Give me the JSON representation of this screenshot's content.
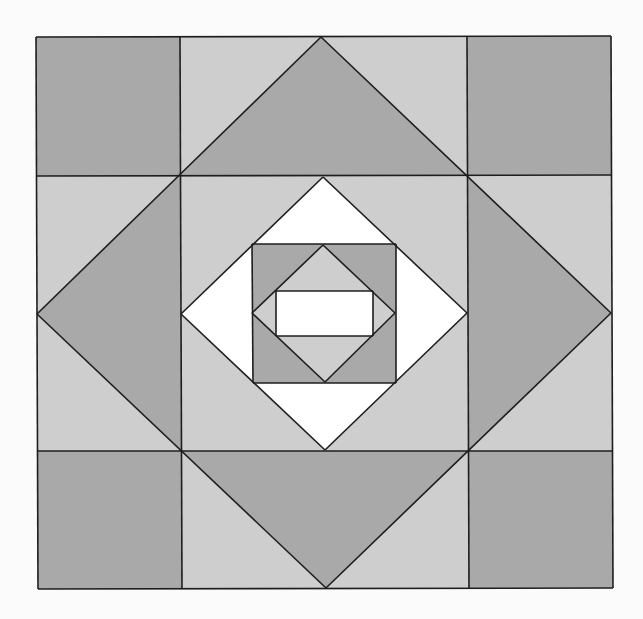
{
  "diagram": {
    "title": "Quilt block pattern: square-in-a-square with diamond centre",
    "canvas": {
      "width": 643,
      "height": 619,
      "background": "#fbfbfb"
    },
    "colors": {
      "dark": "#a9a9a9",
      "light": "#cecece",
      "white": "#ffffff",
      "stroke": "#1e1e1e"
    },
    "outer_square": {
      "tl": [
        36,
        37
      ],
      "tr": [
        611,
        36
      ],
      "br": [
        613,
        588
      ],
      "bl": [
        38,
        589
      ]
    },
    "grid": {
      "x_lines_top": [
        178,
        466
      ],
      "x_lines_bottom": [
        182,
        470
      ],
      "y_lines_left": [
        176,
        451
      ],
      "y_lines_right": [
        175,
        451
      ]
    },
    "big_diamond": {
      "top": [
        321,
        37
      ],
      "right": [
        611,
        313
      ],
      "bottom": [
        326,
        588
      ],
      "left": [
        37,
        314
      ]
    },
    "center_square": {
      "tl": [
        180,
        176
      ],
      "tr": [
        467,
        175
      ],
      "br": [
        469,
        451
      ],
      "bl": [
        182,
        451
      ]
    },
    "white_diamond": {
      "top": [
        323,
        177
      ],
      "right": [
        467,
        313
      ],
      "bottom": [
        325,
        450
      ],
      "left": [
        181,
        314
      ]
    },
    "inner_square": {
      "tl": [
        252,
        244
      ],
      "tr": [
        396,
        244
      ],
      "br": [
        396,
        383
      ],
      "bl": [
        253,
        383
      ]
    },
    "inner_diamond": {
      "top": [
        323,
        245
      ],
      "right": [
        395,
        313
      ],
      "bottom": [
        325,
        382
      ],
      "left": [
        252,
        313
      ]
    },
    "center_rect": {
      "tl": [
        276,
        291
      ],
      "tr": [
        373,
        291
      ],
      "br": [
        373,
        336
      ],
      "bl": [
        276,
        336
      ]
    }
  }
}
